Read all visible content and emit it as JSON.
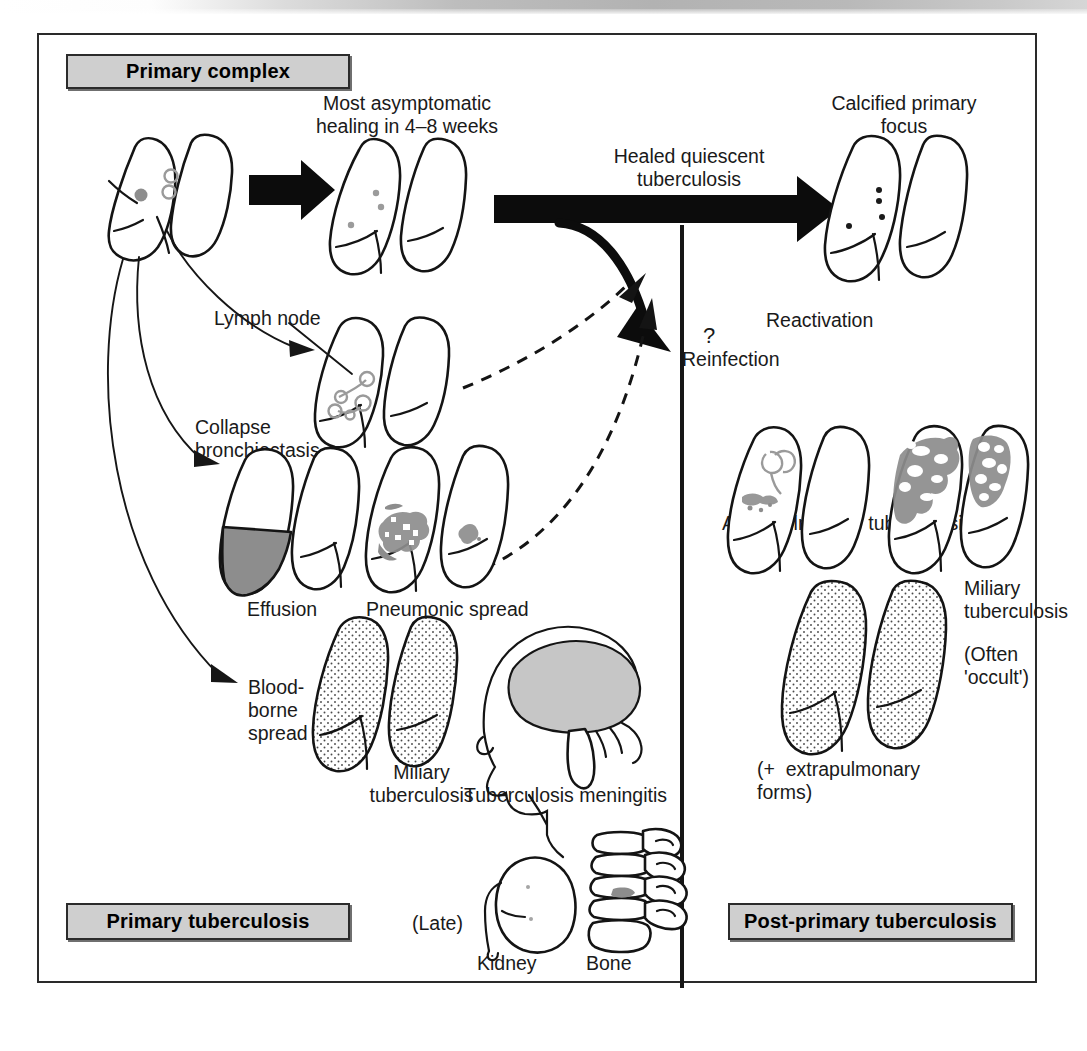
{
  "figure": {
    "frame_border_color": "#2a2a2a",
    "background": "#ffffff"
  },
  "title_boxes": {
    "primary_complex": "Primary complex",
    "primary_tuberculosis": "Primary tuberculosis",
    "post_primary_tuberculosis": "Post-primary tuberculosis",
    "fill_color": "#cfcfcf",
    "border_color": "#2b2b2b"
  },
  "labels": {
    "most_asymptomatic": "Most asymptomatic\nhealing in 4–8 weeks",
    "healed_quiescent": "Healed quiescent\ntuberculosis",
    "calcified_primary_focus": "Calcified primary\nfocus",
    "lymph_node": "Lymph node",
    "collapse_bronchiectasis": "Collapse\nbronchiectasis",
    "effusion": "Effusion",
    "pneumonic_spread": "Pneumonic spread",
    "blood_borne_spread": "Blood-\nborne\nspread",
    "miliary_tuberculosis_left": "Miliary\ntuberculosis",
    "tuberculosis_meningitis": "Tuberculosis meningitis",
    "late": "(Late)",
    "kidney": "Kidney",
    "bone": "Bone",
    "reactivation": "Reactivation",
    "question_mark": "?",
    "reinfection": "Reinfection",
    "adult_pulmonary_tuberculosis": "Adult pulmonary tuberculosis",
    "miliary_tuberculosis_right": "Miliary\ntuberculosis",
    "often_occult": "(Often\n'occult')",
    "extrapulmonary_forms": "(+  extrapulmonary\nforms)"
  },
  "colors": {
    "ink": "#141414",
    "title_box_fill": "#cfcfcf",
    "effusion_gray": "#8d8d8d",
    "brain_gray": "#c6c6c6",
    "lesion_gray": "#8a8a8a",
    "scan_band_gray": "#b2b2b2"
  }
}
